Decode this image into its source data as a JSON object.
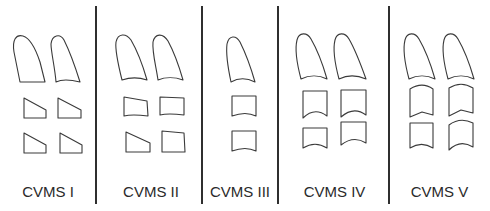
{
  "figure": {
    "stroke_color": "#3a3a3a",
    "divider_color": "#2f2f2f",
    "stages": [
      {
        "label": "CVMS I",
        "description": "C2 with flat lower border; C3 and C4 trapezoid, flat lower borders"
      },
      {
        "label": "CVMS II",
        "description": "Concavity at lower border of C2; C3/C4 trapezoid"
      },
      {
        "label": "CVMS III",
        "description": "Concavity at lower borders of C2 and C3; C3/C4 rectangular horizontal"
      },
      {
        "label": "CVMS IV",
        "description": "Concavities at C2, C3, C4; bodies rectangular horizontal"
      },
      {
        "label": "CVMS V",
        "description": "Concavities at C2, C3, C4; bodies square / rectangular vertical"
      }
    ]
  }
}
